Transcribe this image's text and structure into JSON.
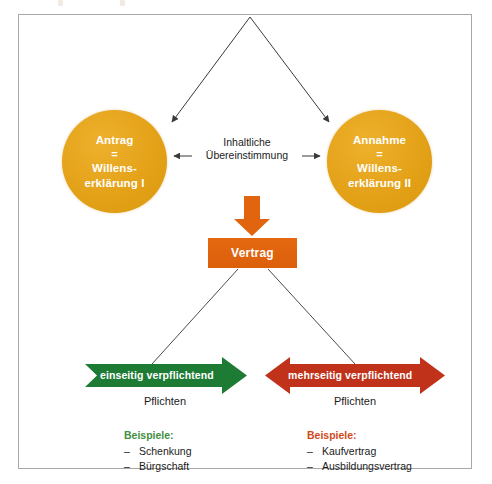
{
  "diagram": {
    "colors": {
      "circle_fill": "#e8a317",
      "contract_fill": "#e1640f",
      "arrow_down_fill": "#e1640f",
      "green": "#1e7b34",
      "red": "#c0321a",
      "line": "#4a4a4a",
      "frame": "#a8a8a8",
      "text": "#1b1b1b"
    },
    "nodes": {
      "antrag": {
        "line1": "Antrag",
        "line2": "=",
        "line3": "Willens-",
        "line4": "erklärung I"
      },
      "annahme": {
        "line1": "Annahme",
        "line2": "=",
        "line3": "Willens-",
        "line4": "erklärung II"
      },
      "center": {
        "line1": "Inhaltliche",
        "line2": "Übereinstimmung"
      },
      "vertrag": {
        "label": "Vertrag"
      }
    },
    "branches": [
      {
        "key": "einseitig",
        "banner_label": "einseitig verpflichtend",
        "caption": "Pflichten",
        "examples_heading": "Beispiele:",
        "examples": [
          "Schenkung",
          "Bürgschaft"
        ],
        "dash": "–",
        "color": "#1e7b34",
        "arrow_type": "single-right"
      },
      {
        "key": "mehrseitig",
        "banner_label": "mehrseitig verpflichtend",
        "caption": "Pflichten",
        "examples_heading": "Beispiele:",
        "examples": [
          "Kaufvertrag",
          "Ausbildungsvertrag"
        ],
        "dash": "–",
        "color": "#c0321a",
        "arrow_type": "double"
      }
    ]
  }
}
